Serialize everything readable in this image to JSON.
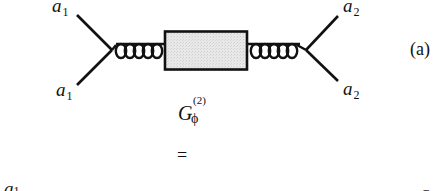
{
  "diagram": {
    "type": "feynman-diagram",
    "panel_label": "(a)",
    "external_legs": {
      "top_left": "a",
      "top_left_index": "1",
      "bottom_left": "a",
      "bottom_left_index": "1",
      "top_right": "a",
      "top_right_index": "2",
      "bottom_right": "a",
      "bottom_right_index": "2"
    },
    "propagators": {
      "left": "gluon-coil",
      "right": "gluon-coil",
      "coil_loops_per_side": 5
    },
    "blob": {
      "shape": "rectangle",
      "fill": "#e6e6e6",
      "border": "#111111"
    },
    "caption": {
      "symbol": "G",
      "superscript": "(2)",
      "subscript": "ϕ"
    },
    "equals": "=",
    "next_row_partial": {
      "left_label": "a",
      "left_index": "1",
      "right_label": "a"
    }
  }
}
